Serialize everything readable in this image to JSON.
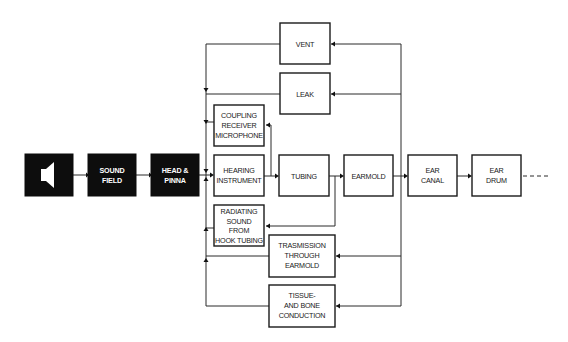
{
  "diagram": {
    "type": "block-flow-diagram",
    "main_chain": {
      "speaker": {
        "icon": "speaker-icon",
        "label": ""
      },
      "sound_field": {
        "line1": "SOUND",
        "line2": "FIELD"
      },
      "head_pinna": {
        "line1": "HEAD &",
        "line2": "PINNA"
      },
      "hearing_instrument": {
        "line1": "HEARING",
        "line2": "INSTRUMENT"
      },
      "tubing": {
        "line1": "TUBING"
      },
      "earmold": {
        "line1": "EARMOLD"
      },
      "ear_canal": {
        "line1": "EAR",
        "line2": "CANAL"
      },
      "ear_drum": {
        "line1": "EAR",
        "line2": "DRUM"
      }
    },
    "feedback_paths": {
      "vent": {
        "line1": "VENT"
      },
      "leak": {
        "line1": "LEAK"
      },
      "coupling": {
        "line1": "COUPLING",
        "line2": "RECEIVER",
        "line3": "MICROPHONE"
      },
      "radiating": {
        "line1": "RADIATING",
        "line2": "SOUND",
        "line3": "FROM",
        "line4": "HOOK TUBING"
      },
      "transmission": {
        "line1": "TRASMISSION",
        "line2": "THROUGH",
        "line3": "EARMOLD"
      },
      "tissue": {
        "line1": "TISSUE-",
        "line2": "AND BONE",
        "line3": "CONDUCTION"
      }
    },
    "colors": {
      "dark_box": "#0d0d0d",
      "light_box_border": "#1a1a1a",
      "line": "#2a2a2a",
      "background": "#ffffff"
    }
  }
}
